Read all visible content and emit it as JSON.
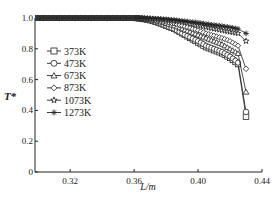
{
  "chart_data": {
    "type": "line",
    "title": "",
    "xlabel": "L/m",
    "ylabel": "T*",
    "xlim": [
      0.298,
      0.44
    ],
    "ylim": [
      0,
      1.0
    ],
    "x_ticks": [
      "0.32",
      "0.36",
      "0.40",
      "0.44"
    ],
    "x_tick_values": [
      0.32,
      0.36,
      0.4,
      0.44
    ],
    "y_ticks": [
      "0",
      "0.2",
      "0.4",
      "0.6",
      "0.8",
      "1.0"
    ],
    "y_tick_values": [
      0,
      0.2,
      0.4,
      0.6,
      0.8,
      1.0
    ],
    "grid": false,
    "legend_position": "upper-left inside",
    "series": [
      {
        "name": "373K",
        "marker": "square",
        "x": [
          0.3,
          0.31,
          0.32,
          0.33,
          0.34,
          0.35,
          0.36,
          0.365,
          0.37,
          0.375,
          0.38,
          0.385,
          0.39,
          0.395,
          0.4,
          0.405,
          0.41,
          0.415,
          0.42,
          0.425,
          0.43
        ],
        "y": [
          1.0,
          1.0,
          1.0,
          1.0,
          1.0,
          1.0,
          1.0,
          0.995,
          0.985,
          0.97,
          0.95,
          0.93,
          0.9,
          0.87,
          0.84,
          0.81,
          0.79,
          0.77,
          0.74,
          0.7,
          0.36
        ]
      },
      {
        "name": "473K",
        "marker": "circle",
        "x": [
          0.3,
          0.31,
          0.32,
          0.33,
          0.34,
          0.35,
          0.36,
          0.365,
          0.37,
          0.375,
          0.38,
          0.385,
          0.39,
          0.395,
          0.4,
          0.405,
          0.41,
          0.415,
          0.42,
          0.425,
          0.43
        ],
        "y": [
          1.0,
          1.0,
          1.0,
          1.0,
          1.0,
          1.0,
          1.0,
          0.995,
          0.985,
          0.97,
          0.95,
          0.93,
          0.9,
          0.875,
          0.85,
          0.82,
          0.8,
          0.78,
          0.75,
          0.71,
          0.39
        ]
      },
      {
        "name": "673K",
        "marker": "triangle",
        "x": [
          0.3,
          0.31,
          0.32,
          0.33,
          0.34,
          0.35,
          0.36,
          0.365,
          0.37,
          0.375,
          0.38,
          0.385,
          0.39,
          0.395,
          0.4,
          0.405,
          0.41,
          0.415,
          0.42,
          0.425,
          0.43
        ],
        "y": [
          1.0,
          1.0,
          1.0,
          1.0,
          1.0,
          1.0,
          1.0,
          0.996,
          0.99,
          0.98,
          0.965,
          0.95,
          0.93,
          0.91,
          0.89,
          0.87,
          0.85,
          0.83,
          0.8,
          0.77,
          0.52
        ]
      },
      {
        "name": "873K",
        "marker": "diamond",
        "x": [
          0.3,
          0.31,
          0.32,
          0.33,
          0.34,
          0.35,
          0.36,
          0.365,
          0.37,
          0.375,
          0.38,
          0.385,
          0.39,
          0.395,
          0.4,
          0.405,
          0.41,
          0.415,
          0.42,
          0.425,
          0.43
        ],
        "y": [
          1.0,
          1.0,
          1.0,
          1.0,
          1.0,
          1.0,
          1.0,
          0.997,
          0.993,
          0.985,
          0.975,
          0.965,
          0.95,
          0.935,
          0.92,
          0.9,
          0.885,
          0.87,
          0.85,
          0.82,
          0.67
        ]
      },
      {
        "name": "1073K",
        "marker": "star",
        "x": [
          0.3,
          0.31,
          0.32,
          0.33,
          0.34,
          0.35,
          0.36,
          0.365,
          0.37,
          0.375,
          0.38,
          0.385,
          0.39,
          0.395,
          0.4,
          0.405,
          0.41,
          0.415,
          0.42,
          0.425,
          0.43
        ],
        "y": [
          1.0,
          1.0,
          1.0,
          1.0,
          1.0,
          1.0,
          1.0,
          0.998,
          0.996,
          0.992,
          0.986,
          0.98,
          0.972,
          0.962,
          0.952,
          0.94,
          0.93,
          0.92,
          0.91,
          0.9,
          0.85
        ]
      },
      {
        "name": "1273K",
        "marker": "asterisk",
        "x": [
          0.3,
          0.31,
          0.32,
          0.33,
          0.34,
          0.35,
          0.36,
          0.365,
          0.37,
          0.375,
          0.38,
          0.385,
          0.39,
          0.395,
          0.4,
          0.405,
          0.41,
          0.415,
          0.42,
          0.425,
          0.43
        ],
        "y": [
          1.0,
          1.0,
          1.0,
          1.0,
          1.0,
          1.0,
          1.0,
          0.999,
          0.998,
          0.996,
          0.992,
          0.988,
          0.982,
          0.976,
          0.97,
          0.962,
          0.955,
          0.948,
          0.94,
          0.93,
          0.9
        ]
      }
    ]
  },
  "layout": {
    "plot_left": 35,
    "plot_right": 262,
    "plot_top": 18,
    "plot_bottom": 172,
    "line_color": "#222222"
  }
}
